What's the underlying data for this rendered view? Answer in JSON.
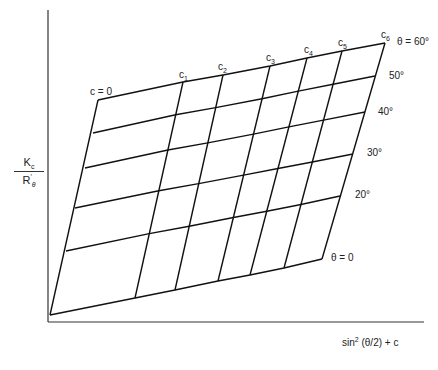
{
  "figure": {
    "y_axis_label": {
      "numerator": "K",
      "numerator_sub": "c",
      "denominator": "R",
      "denominator_prime": "′",
      "denominator_sub": "θ"
    },
    "x_axis_label": {
      "text_pre": "sin",
      "sup": "2",
      "text_post": " (θ/2) + c"
    },
    "c_labels": [
      "c = 0",
      "c",
      "c",
      "c",
      "c",
      "c",
      "c"
    ],
    "c_subscripts": [
      "",
      "1",
      "2",
      "3",
      "4",
      "5",
      "6"
    ],
    "theta_labels": [
      "θ = 0",
      "20°",
      "30°",
      "40°",
      "50°",
      "θ = 60°"
    ],
    "line_color": "#111111"
  },
  "chart_data": {
    "type": "diagram",
    "title": "",
    "xlabel": "sin²(θ/2) + c",
    "ylabel": "Kc / R′θ",
    "families": {
      "constant_c": [
        "c = 0",
        "c1",
        "c2",
        "c3",
        "c4",
        "c5",
        "c6"
      ],
      "constant_theta": [
        "θ = 0",
        "20°",
        "30°",
        "40°",
        "50°",
        "θ = 60°"
      ]
    },
    "axes_px": {
      "origin": [
        48,
        322
      ],
      "y_top": [
        48,
        10
      ],
      "x_end": [
        424,
        322
      ]
    },
    "grid_px": {
      "top_edge_c_points": [
        [
          98,
          100
        ],
        [
          183,
          82
        ],
        [
          223,
          75
        ],
        [
          270,
          66
        ],
        [
          307,
          58
        ],
        [
          342,
          51
        ],
        [
          385,
          43
        ]
      ],
      "bottom_edge_c_points": [
        [
          50,
          315
        ],
        [
          135,
          298
        ],
        [
          175,
          290
        ],
        [
          218,
          281
        ],
        [
          250,
          275
        ],
        [
          284,
          268
        ],
        [
          322,
          259
        ]
      ],
      "left_edge_theta_points": [
        [
          50,
          315
        ],
        [
          66,
          251
        ],
        [
          75,
          208
        ],
        [
          85,
          168
        ],
        [
          93,
          133
        ],
        [
          98,
          100
        ]
      ],
      "right_edge_theta_points": [
        [
          322,
          259
        ],
        [
          340,
          196
        ],
        [
          353,
          154
        ],
        [
          365,
          112
        ],
        [
          375,
          76
        ],
        [
          385,
          43
        ]
      ]
    },
    "grid": false,
    "legend": "none"
  }
}
